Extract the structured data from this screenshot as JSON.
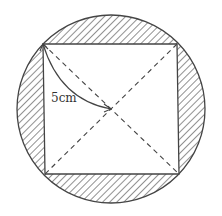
{
  "diagram": {
    "type": "geometry",
    "label": "5cm",
    "circle": {
      "cx": 111,
      "cy": 109,
      "r": 94
    },
    "square": {
      "corners": [
        [
          43,
          44
        ],
        [
          177,
          44
        ],
        [
          179,
          174
        ],
        [
          45,
          174
        ]
      ]
    },
    "center": [
      111,
      109
    ],
    "colors": {
      "stroke": "#444444",
      "hatch": "#555555",
      "background": "#ffffff"
    }
  }
}
